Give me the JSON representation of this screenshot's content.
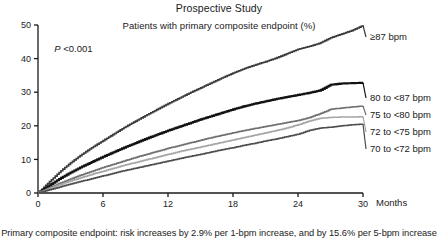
{
  "figure": {
    "title": "Prospective Study",
    "subtitle": "Patients with primary composite endpoint (%)",
    "pvalue_prefix": "P",
    "pvalue_text": " <0.001",
    "footnote": "Primary composite endpoint: risk increases by 2.9% per 1-bpm increase, and by 15.6% per 5-bpm increase"
  },
  "chart_data": {
    "type": "line",
    "title": "Prospective Study",
    "subtitle": "Patients with primary composite endpoint (%)",
    "xlabel": "Months",
    "ylabel": "Patients with primary composite endpoint (%)",
    "xlim": [
      0,
      30
    ],
    "ylim": [
      0,
      50
    ],
    "xticks": [
      0,
      6,
      12,
      18,
      24,
      30
    ],
    "yticks": [
      0,
      10,
      20,
      30,
      40,
      50
    ],
    "grid": false,
    "legend": "inline-right-end-labels",
    "annotations": [
      {
        "text": "P <0.001",
        "x": 1.5,
        "y": 42
      }
    ],
    "x": [
      0,
      1,
      2,
      3,
      4,
      5,
      6,
      7,
      8,
      9,
      10,
      11,
      12,
      13,
      14,
      15,
      16,
      17,
      18,
      19,
      20,
      21,
      22,
      23,
      24,
      25,
      26,
      27,
      28,
      29,
      30
    ],
    "series": [
      {
        "name": "≥87 bpm",
        "label": "≥87 bpm",
        "color": "#3a3a3a",
        "width": 1.6,
        "values": [
          0,
          3.2,
          6.3,
          9.0,
          11.4,
          13.6,
          15.6,
          17.6,
          19.6,
          21.4,
          23.2,
          24.9,
          26.6,
          28.2,
          29.8,
          31.3,
          32.8,
          34.3,
          35.7,
          37.0,
          38.1,
          39.1,
          40.2,
          41.5,
          42.8,
          43.6,
          44.6,
          46.2,
          47.3,
          48.4,
          49.9
        ]
      },
      {
        "name": "80 to <87 bpm",
        "label": "80 to <87 bpm",
        "color": "#121212",
        "width": 2.1,
        "values": [
          0,
          2.2,
          4.3,
          6.1,
          7.8,
          9.3,
          10.8,
          12.2,
          13.6,
          14.9,
          16.2,
          17.4,
          18.6,
          19.7,
          20.8,
          21.9,
          22.9,
          23.9,
          24.9,
          25.8,
          26.6,
          27.3,
          28.0,
          28.6,
          29.2,
          29.8,
          30.5,
          32.2,
          32.6,
          32.7,
          32.8
        ]
      },
      {
        "name": "75 to <80 bpm",
        "label": "75 to <80 bpm",
        "color": "#6f6f6f",
        "width": 1.5,
        "values": [
          0,
          1.5,
          2.9,
          4.2,
          5.4,
          6.5,
          7.6,
          8.6,
          9.6,
          10.6,
          11.5,
          12.4,
          13.3,
          14.1,
          14.9,
          15.7,
          16.5,
          17.2,
          17.9,
          18.6,
          19.2,
          19.8,
          20.4,
          21.0,
          21.6,
          22.4,
          23.6,
          24.9,
          25.3,
          25.6,
          25.9
        ]
      },
      {
        "name": "72 to <75 bpm",
        "label": "72 to <75 bpm",
        "color": "#a5a5a5",
        "width": 1.5,
        "values": [
          0,
          1.3,
          2.5,
          3.6,
          4.6,
          5.6,
          6.5,
          7.4,
          8.3,
          9.1,
          9.9,
          10.7,
          11.5,
          12.3,
          13.0,
          13.7,
          14.4,
          15.1,
          15.8,
          16.5,
          17.2,
          17.9,
          18.6,
          19.4,
          20.3,
          21.4,
          22.2,
          22.5,
          22.6,
          22.6,
          22.7
        ]
      },
      {
        "name": "70 to <72 bpm",
        "label": "70 to <72 bpm",
        "color": "#4d4d4d",
        "width": 1.5,
        "values": [
          0,
          0.9,
          1.8,
          2.7,
          3.5,
          4.3,
          5.1,
          5.9,
          6.7,
          7.4,
          8.1,
          8.8,
          9.5,
          10.2,
          10.9,
          11.5,
          12.2,
          12.9,
          13.5,
          14.2,
          14.8,
          15.5,
          16.1,
          16.8,
          17.5,
          18.6,
          19.3,
          19.6,
          20.0,
          20.3,
          20.5
        ]
      }
    ]
  },
  "axes": {
    "x_name": "Months",
    "x_tick_labels": [
      "0",
      "6",
      "12",
      "18",
      "24",
      "30"
    ],
    "y_tick_labels": [
      "0",
      "10",
      "20",
      "30",
      "40",
      "50"
    ]
  },
  "colors": {
    "axis": "#1a1a1a",
    "background": "#ffffff"
  }
}
